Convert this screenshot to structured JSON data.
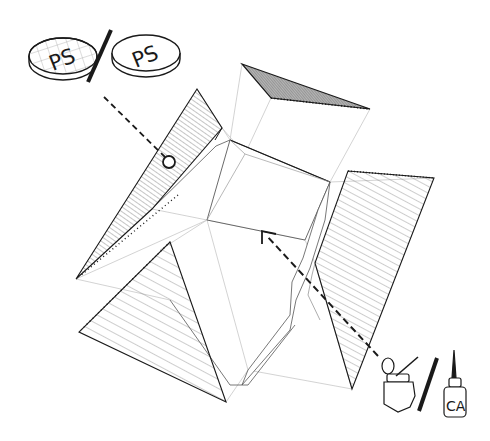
{
  "diagram": {
    "width": 490,
    "height": 441,
    "colors": {
      "ink": "#1a1a1a",
      "hatch": "#6e6e6e",
      "guide": "#c8c8c8",
      "top_fill": "#9a9a9a",
      "background": "#ffffff"
    },
    "legend": {
      "material_options": {
        "option_a": {
          "label": "PS",
          "kind": "ps-sheet-gridded"
        },
        "separator": "/",
        "option_b": {
          "label": "PS",
          "kind": "ps-sheet-plain"
        }
      },
      "adhesive_options": {
        "option_a": {
          "label": "",
          "kind": "solvent-glue-bottle-with-brush"
        },
        "separator": "/",
        "option_b": {
          "label": "CA",
          "kind": "ca-glue-bottle"
        }
      }
    },
    "callouts": [
      {
        "name": "material-callout",
        "from": [
          104,
          97
        ],
        "to": [
          169,
          162
        ],
        "end": "circle"
      },
      {
        "name": "glue-callout",
        "from": [
          378,
          356
        ],
        "to": [
          262,
          231
        ],
        "end": "arrow"
      }
    ],
    "parts": {
      "top_panel": {
        "points": [
          [
            242,
            64
          ],
          [
            370,
            109
          ],
          [
            271,
            98
          ]
        ]
      },
      "left_panel": {
        "points": [
          [
            197,
            89
          ],
          [
            222,
            128
          ],
          [
            152,
            209
          ],
          [
            76,
            279
          ]
        ]
      },
      "right_panel": {
        "points": [
          [
            348,
            171
          ],
          [
            434,
            178
          ],
          [
            352,
            389
          ],
          [
            315,
            263
          ]
        ]
      },
      "front_panel": {
        "points": [
          [
            170,
            242
          ],
          [
            226,
            402
          ],
          [
            79,
            332
          ]
        ]
      },
      "core_box": {
        "top_face": [
          [
            230,
            140
          ],
          [
            330,
            182
          ],
          [
            305,
            240
          ],
          [
            207,
            220
          ]
        ],
        "inner_point": [
          245,
          154
        ]
      }
    }
  }
}
